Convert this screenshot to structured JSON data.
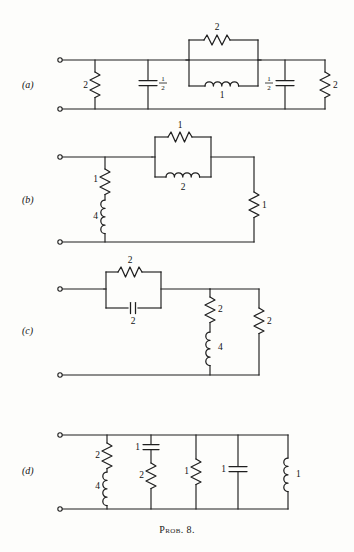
{
  "figure": {
    "caption": "Prob. 8.",
    "panels": [
      {
        "id": "a",
        "label": "(a)",
        "elements": [
          {
            "name": "shunt-resistor-left",
            "type": "resistor",
            "value": "2"
          },
          {
            "name": "shunt-capacitor-left",
            "type": "capacitor",
            "value": "1/2",
            "numerator": "1",
            "denominator": "2"
          },
          {
            "name": "series-block-resistor",
            "type": "resistor",
            "value": "2"
          },
          {
            "name": "series-block-inductor",
            "type": "inductor",
            "value": "1"
          },
          {
            "name": "shunt-capacitor-right",
            "type": "capacitor",
            "value": "1/2",
            "numerator": "1",
            "denominator": "2"
          },
          {
            "name": "shunt-resistor-right",
            "type": "resistor",
            "value": "2"
          }
        ]
      },
      {
        "id": "b",
        "label": "(b)",
        "elements": [
          {
            "name": "shunt-resistor",
            "type": "resistor",
            "value": "1"
          },
          {
            "name": "shunt-inductor",
            "type": "inductor",
            "value": "4"
          },
          {
            "name": "series-block-resistor",
            "type": "resistor",
            "value": "1"
          },
          {
            "name": "series-block-inductor",
            "type": "inductor",
            "value": "2"
          },
          {
            "name": "output-shunt-resistor",
            "type": "resistor",
            "value": "1"
          }
        ]
      },
      {
        "id": "c",
        "label": "(c)",
        "elements": [
          {
            "name": "series-block-resistor",
            "type": "resistor",
            "value": "2"
          },
          {
            "name": "series-block-capacitor",
            "type": "capacitor",
            "value": "2"
          },
          {
            "name": "shunt-resistor",
            "type": "resistor",
            "value": "2"
          },
          {
            "name": "shunt-inductor",
            "type": "inductor",
            "value": "4"
          },
          {
            "name": "output-shunt-resistor",
            "type": "resistor",
            "value": "2"
          }
        ]
      },
      {
        "id": "d",
        "label": "(d)",
        "elements": [
          {
            "name": "branch1-resistor",
            "type": "resistor",
            "value": "2"
          },
          {
            "name": "branch1-inductor",
            "type": "inductor",
            "value": "4"
          },
          {
            "name": "branch2-capacitor",
            "type": "capacitor",
            "value": "1"
          },
          {
            "name": "branch2-resistor",
            "type": "resistor",
            "value": "2"
          },
          {
            "name": "branch3-resistor",
            "type": "resistor",
            "value": "1"
          },
          {
            "name": "branch4-capacitor",
            "type": "capacitor",
            "value": "1"
          },
          {
            "name": "branch5-inductor",
            "type": "inductor",
            "value": "1"
          }
        ]
      }
    ]
  }
}
